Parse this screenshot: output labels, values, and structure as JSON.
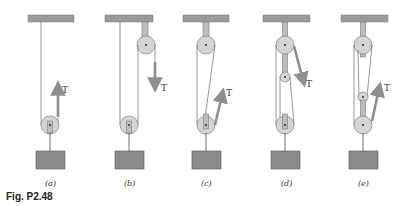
{
  "figure": {
    "caption": "Fig. P2.48",
    "force_label": "T"
  },
  "panels": [
    {
      "id": "a",
      "label": "(a)",
      "description": "single movable pulley, one rope end fixed to ceiling, T pulled upward"
    },
    {
      "id": "b",
      "label": "(b)",
      "description": "movable pulley plus fixed pulley, T pulled downward"
    },
    {
      "id": "c",
      "label": "(c)",
      "description": "fixed top pulley and movable bottom pulley, T pulled upward at an angle"
    },
    {
      "id": "d",
      "label": "(d)",
      "description": "three pulleys (top fixed, small middle, bottom movable), T pulled downward at an angle"
    },
    {
      "id": "e",
      "label": "(e)",
      "description": "three pulleys (top fixed, small middle, bottom movable), T pulled upward at an angle"
    }
  ],
  "colors": {
    "ceiling": "#9a9a9a",
    "pulley": "#d4d4d4",
    "block": "#8a8a8a",
    "arrow": "#8e8e8e",
    "rope": "#6a6a6a"
  }
}
